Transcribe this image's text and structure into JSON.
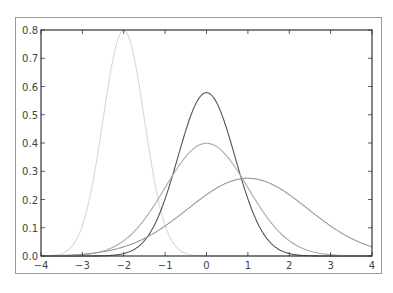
{
  "chart_data": {
    "type": "line",
    "title": "",
    "xlabel": "",
    "ylabel": "",
    "xlim": [
      -4,
      4
    ],
    "ylim": [
      0.0,
      0.8
    ],
    "grid": false,
    "legend": null,
    "x_ticks": [
      "-4",
      "-3",
      "-2",
      "-1",
      "0",
      "1",
      "2",
      "3",
      "4"
    ],
    "y_ticks": [
      "0.0",
      "0.1",
      "0.2",
      "0.3",
      "0.4",
      "0.5",
      "0.6",
      "0.7",
      "0.8"
    ],
    "series": [
      {
        "name": "normal(mu=-2, sigma=0.5)",
        "mu": -2,
        "sigma": 0.5,
        "peak": 0.8,
        "color": "#d8d8d8"
      },
      {
        "name": "normal(mu=0, sigma=0.7)",
        "mu": 0,
        "sigma": 0.69,
        "peak": 0.57,
        "color": "#555555"
      },
      {
        "name": "normal(mu=0, sigma=1)",
        "mu": 0,
        "sigma": 1.0,
        "peak": 0.4,
        "color": "#aaaaaa"
      },
      {
        "name": "normal(mu=1, sigma=1.5)",
        "mu": 1,
        "sigma": 1.45,
        "peak": 0.27,
        "color": "#999999"
      }
    ]
  }
}
